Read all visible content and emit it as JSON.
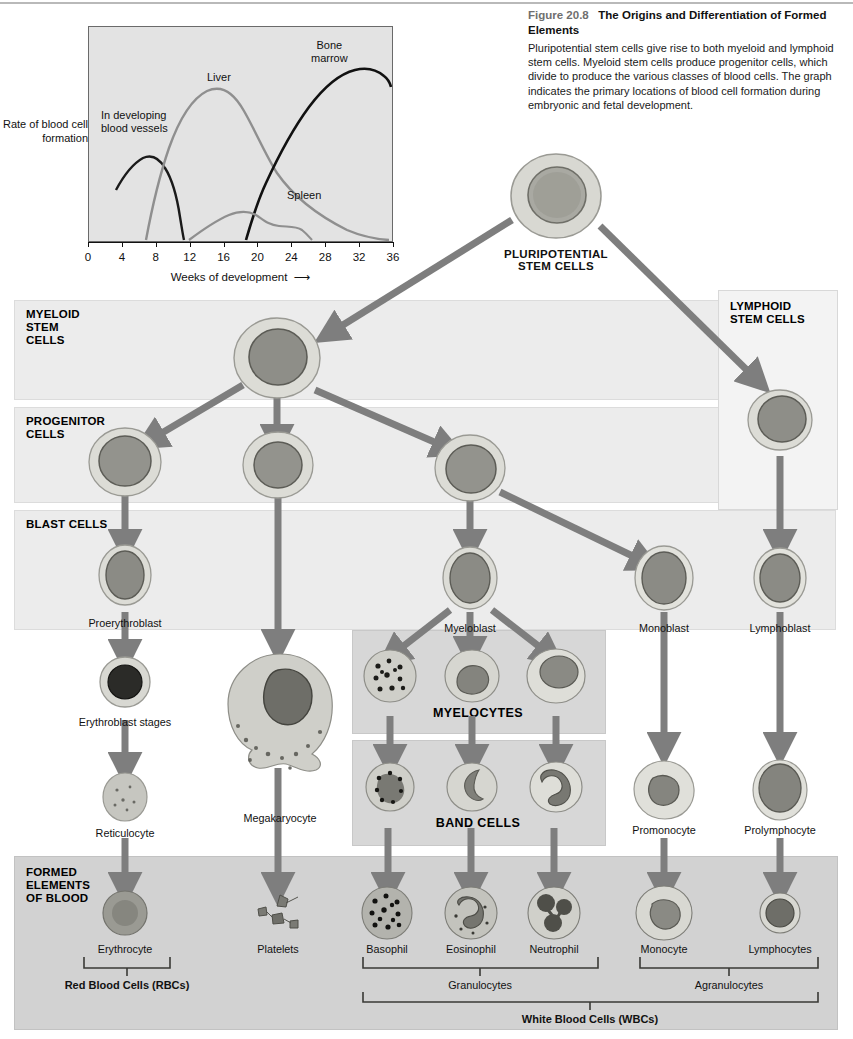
{
  "caption": {
    "figure_number": "Figure 20.8",
    "title": "The Origins and Differentiation of Formed Elements",
    "body": "Pluripotential stem cells give rise to both myeloid and lymphoid stem cells. Myeloid stem cells produce progenitor cells, which divide to produce the various classes of blood cells. The graph indicates the primary locations of blood cell formation during embryonic and fetal development."
  },
  "chart_data": {
    "type": "line",
    "title": "",
    "xlabel": "Weeks of development",
    "ylabel": "Rate of blood cell formation",
    "xlim": [
      0,
      36
    ],
    "ylim": [
      0,
      100
    ],
    "grid": false,
    "legend_position": "inline-annotations",
    "xticks": [
      0,
      4,
      8,
      12,
      16,
      20,
      24,
      28,
      32,
      36
    ],
    "xticklabels": [
      "0",
      "4",
      "8",
      "12",
      "16",
      "20",
      "24",
      "28",
      "32",
      "36"
    ],
    "yticks": [],
    "yticklabels": [],
    "series": [
      {
        "name": "In developing blood vessels",
        "color": "#1a1a1a",
        "label_position": "upper-left",
        "x": [
          3.2,
          4.0,
          5.0,
          6.2,
          7.5,
          8.6,
          9.5,
          10.2,
          10.7,
          11.0
        ],
        "y": [
          24,
          32,
          38,
          40,
          37,
          31,
          23,
          14,
          6,
          0
        ]
      },
      {
        "name": "Liver",
        "color": "#8c8c8c",
        "label_position": "upper-middle",
        "x": [
          6.8,
          8.0,
          9.5,
          11.0,
          12.5,
          14.0,
          15.5,
          17.5,
          20.0,
          23.0,
          26.0,
          29.0,
          32.0,
          34.0,
          36.0
        ],
        "y": [
          0,
          20,
          48,
          68,
          80,
          86,
          84,
          76,
          64,
          50,
          38,
          27,
          16,
          8,
          0
        ]
      },
      {
        "name": "Bone marrow",
        "color": "#111111",
        "label_position": "upper-right",
        "x": [
          18.7,
          19.5,
          20.5,
          22.0,
          23.5,
          25.0,
          26.5,
          28.0,
          29.5,
          31.0,
          32.5,
          34.0,
          36.0
        ],
        "y": [
          0,
          14,
          30,
          52,
          66,
          76,
          84,
          90,
          93,
          94,
          92,
          90,
          91
        ]
      },
      {
        "name": "Spleen",
        "color": "#8c8c8c",
        "label_position": "lower-right",
        "x": [
          12.0,
          13.5,
          15.0,
          16.5,
          18.0,
          19.5,
          21.0,
          23.0,
          25.0,
          26.0,
          26.8
        ],
        "y": [
          0,
          4,
          8,
          12,
          13,
          11,
          9,
          9,
          8,
          4,
          0
        ]
      }
    ],
    "annotations": [
      {
        "text": "In developing blood vessels",
        "x": 5.0,
        "y": 57
      },
      {
        "text": "Liver",
        "x": 14.0,
        "y": 94
      },
      {
        "text": "Bone marrow",
        "x": 30.0,
        "y": 106
      },
      {
        "text": "Spleen",
        "x": 25.0,
        "y": 20
      }
    ]
  },
  "diagram": {
    "bands": [
      {
        "id": "myeloid",
        "label": "MYELOID\nSTEM\nCELLS"
      },
      {
        "id": "progenitor",
        "label": "PROGENITOR\nCELLS"
      },
      {
        "id": "blast",
        "label": "BLAST CELLS"
      },
      {
        "id": "formed",
        "label": "FORMED\nELEMENTS\nOF BLOOD"
      }
    ],
    "band_labels": {
      "myeloid_l1": "MYELOID",
      "myeloid_l2": "STEM",
      "myeloid_l3": "CELLS",
      "progenitor_l1": "PROGENITOR",
      "progenitor_l2": "CELLS",
      "blast": "BLAST CELLS",
      "formed_l1": "FORMED",
      "formed_l2": "ELEMENTS",
      "formed_l3": "OF BLOOD",
      "lymphoid_l1": "LYMPHOID",
      "lymphoid_l2": "STEM CELLS"
    },
    "boxes": {
      "myelocytes": "MYELOCYTES",
      "band_cells": "BAND CELLS"
    },
    "top": {
      "pluripotential_l1": "PLURIPOTENTIAL",
      "pluripotential_l2": "STEM CELLS"
    },
    "blast_labels": {
      "proerythroblast": "Proerythroblast",
      "myeloblast": "Myeloblast",
      "monoblast": "Monoblast",
      "lymphoblast": "Lymphoblast"
    },
    "mid_labels": {
      "erythroblast_stages": "Erythroblast stages",
      "reticulocyte": "Reticulocyte",
      "megakaryocyte": "Megakaryocyte",
      "promonocyte": "Promonocyte",
      "prolymphocyte": "Prolymphocyte"
    },
    "formed_labels": {
      "erythrocyte": "Erythrocyte",
      "platelets": "Platelets",
      "basophil": "Basophil",
      "eosinophil": "Eosinophil",
      "neutrophil": "Neutrophil",
      "monocyte": "Monocyte",
      "lymphocytes": "Lymphocytes"
    },
    "brackets": {
      "rbc": "Red Blood Cells (RBCs)",
      "granulocytes": "Granulocytes",
      "agranulocytes": "Agranulocytes",
      "wbc": "White Blood Cells (WBCs)"
    },
    "colors": {
      "arrow": "#7e7e7e",
      "band_bg": "#ececec",
      "formed_bg": "#d2d2d2",
      "subbox_bg": "#d7d7d7",
      "plot_bg": "#e3e3e3",
      "text": "#111111",
      "caption_figno": "#6f6f6f"
    }
  }
}
